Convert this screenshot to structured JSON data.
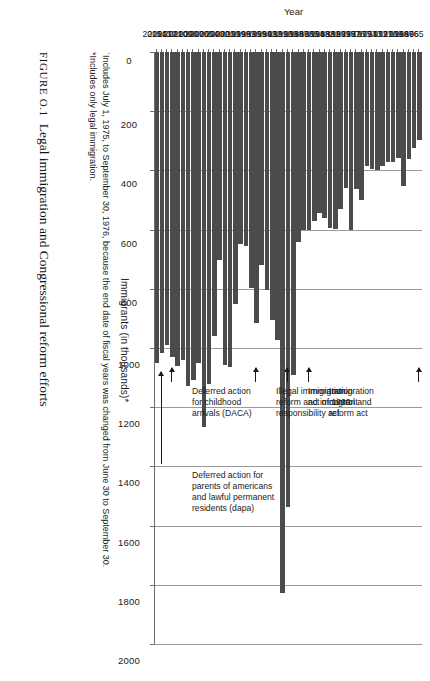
{
  "figure": {
    "number_label": "FIGURE O.1",
    "caption": "Legal immigration and Congressional reform efforts"
  },
  "footnotes": [
    "ˈIncludes July 1, 1975, to September 30, 1976, because the end date of fiscal years was changed from June 30 to September 30.",
    "*Includes only legal immigration."
  ],
  "annotations": [
    {
      "id": "ina-amendments",
      "text": "Immigration and\nnationality act\namendments",
      "target_year": "1965"
    },
    {
      "id": "irca",
      "text": "Immigration\ncontrol and\nreform act",
      "target_year": "1986"
    },
    {
      "id": "ia1990",
      "text": "Immigration\nact of 1990",
      "target_year": "1990"
    },
    {
      "id": "iirira",
      "text": "Illegal immigration\nreform and immigrant\nresponsibility act",
      "target_year": "1996"
    },
    {
      "id": "daca",
      "text": "Deferred action\nfor childhood\narrivals (DACA)",
      "target_year": "2012"
    },
    {
      "id": "dapa",
      "text": "Deferred action for\nparents of americans\nand lawful permanent\nresidents (dapa)",
      "target_year": "2014"
    }
  ],
  "chart_data": {
    "type": "bar",
    "orientation": "horizontal",
    "title": "",
    "xlabel": "Year",
    "ylabel": "Immigrants (in thousands)*",
    "ylim": [
      0,
      2000
    ],
    "yticks": [
      0,
      200,
      400,
      600,
      800,
      1000,
      1200,
      1400,
      1600,
      1800,
      2000
    ],
    "ytick_labels": [
      "0",
      "200",
      "400",
      "600",
      "800",
      "1000",
      "1200",
      "1400",
      "1600",
      "1800",
      "2000"
    ],
    "grid": true,
    "legend": "none",
    "bar_color": "#4b4b4b",
    "categories": [
      "1965",
      "1966",
      "1967",
      "1968",
      "1969",
      "1970",
      "1971",
      "1972",
      "1973",
      "1974",
      "1975",
      "1976ˈ",
      "1977",
      "1978",
      "1979",
      "1980",
      "1981",
      "1982",
      "1983",
      "1984",
      "1985",
      "1986",
      "1987",
      "1988",
      "1989",
      "1990",
      "1991",
      "1992",
      "1993",
      "1994",
      "1995",
      "1996",
      "1997",
      "1998",
      "1999",
      "2000",
      "2001",
      "2002",
      "2003",
      "2004",
      "2005",
      "2006",
      "2007",
      "2008",
      "2009",
      "2010",
      "2011",
      "2012",
      "2013",
      "2014",
      "2015"
    ],
    "values": [
      297,
      323,
      362,
      454,
      359,
      373,
      370,
      385,
      400,
      395,
      386,
      499,
      462,
      601,
      460,
      531,
      597,
      594,
      560,
      544,
      570,
      602,
      602,
      643,
      1091,
      1536,
      1827,
      974,
      904,
      804,
      721,
      916,
      798,
      654,
      647,
      850,
      1064,
      1059,
      704,
      958,
      1122,
      1266,
      1052,
      1107,
      1130,
      1042,
      1062,
      1031,
      991,
      1016,
      1051
    ]
  }
}
